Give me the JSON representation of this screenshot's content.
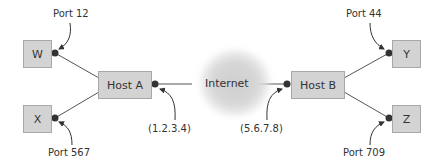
{
  "diagram": {
    "type": "network-port-diagram",
    "nodes": {
      "w": {
        "label": "W"
      },
      "x": {
        "label": "X"
      },
      "host_a": {
        "label": "Host A"
      },
      "internet": {
        "label": "Internet"
      },
      "host_b": {
        "label": "Host B"
      },
      "y": {
        "label": "Y"
      },
      "z": {
        "label": "Z"
      }
    },
    "annotations": {
      "port_w": "Port 12",
      "port_x": "Port 567",
      "addr_a": "(1.2.3.4)",
      "addr_b": "(5.6.7.8)",
      "port_y": "Port 44",
      "port_z": "Port 709"
    },
    "edges": [
      {
        "from": "W",
        "to": "Host A"
      },
      {
        "from": "X",
        "to": "Host A"
      },
      {
        "from": "Host A",
        "to": "Internet"
      },
      {
        "from": "Internet",
        "to": "Host B"
      },
      {
        "from": "Host B",
        "to": "Y"
      },
      {
        "from": "Host B",
        "to": "Z"
      }
    ],
    "colors": {
      "box_fill": "#d3d3d3",
      "box_border": "#a8a8a8",
      "line": "#555555",
      "dot": "#333333",
      "cloud": "#d0d0d0"
    }
  }
}
